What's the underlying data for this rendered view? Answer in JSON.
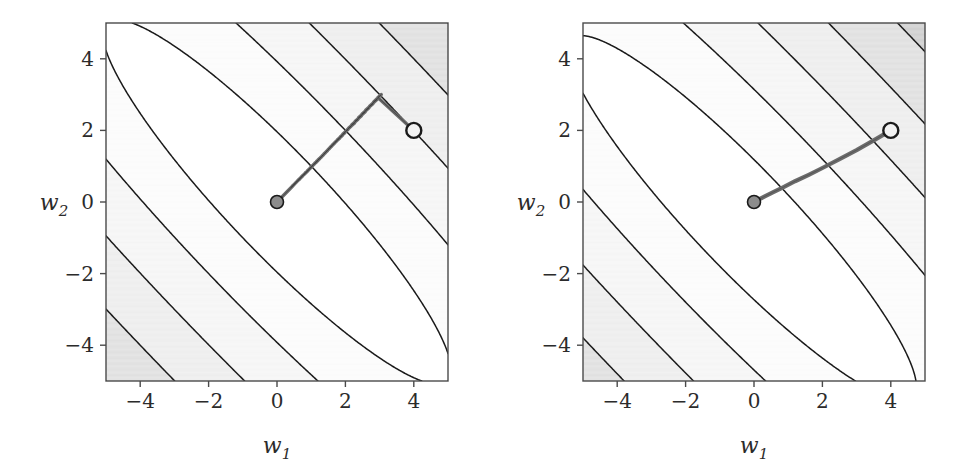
{
  "figure": {
    "background": "#ffffff",
    "panel_count": 2,
    "line_color": "#1a1a1a",
    "path_color": "#6b6b6b",
    "start_marker_fill": "#f2f2f2",
    "end_marker_fill": "#8c8c8c",
    "marker_stroke": "#1a1a1a"
  },
  "chart_data": [
    {
      "type": "line",
      "title": "",
      "subtitle": "",
      "panel": "left",
      "xlabel": "w_1",
      "xlabel_display": "w",
      "xlabel_sub": "1",
      "ylabel": "w_2",
      "ylabel_display": "w",
      "ylabel_sub": "2",
      "xlim": [
        -5,
        5
      ],
      "ylim": [
        -5,
        5
      ],
      "xticks": [
        -4,
        -2,
        0,
        2,
        4
      ],
      "xticklabels": [
        "-4",
        "-2",
        "0",
        "2",
        "4"
      ],
      "yticks": [
        -4,
        -2,
        0,
        2,
        4
      ],
      "yticklabels": [
        "-4",
        "-2",
        "0",
        "2",
        "4"
      ],
      "grid": false,
      "legend": "none",
      "background_type": "filled-contour-grayscale",
      "contour_description": "Elongated concentric ellipses of an ill-conditioned quadratic, major axis along the +45 degree diagonal, centred at the origin; outer levels become straight diagonal bands shaded from white near the valley to dark grey in the top-left and bottom-right corners.",
      "contour_levels": [
        2,
        8,
        18,
        32,
        50,
        72,
        98,
        128,
        162
      ],
      "band_colors": [
        "#ffffff",
        "#fbfbfb",
        "#f4f4f4",
        "#ebebeb",
        "#dcdcdc",
        "#c9c9c9",
        "#a8a8a8",
        "#808080"
      ],
      "ellipse_axis_ratio": 0.2,
      "ellipse_rotation_deg": -45,
      "series": [
        {
          "name": "gradient-descent-zigzag-path",
          "description": "Zig-zagging gradient descent trajectory oscillating across the narrow valley while slowly creeping toward the minimum.",
          "start": [
            4,
            2
          ],
          "end": [
            0,
            0
          ],
          "oscillation_count": 46,
          "x": [
            4.0,
            2.95,
            3.05,
            2.82,
            2.93,
            2.7,
            2.81,
            2.59,
            2.69,
            2.48,
            2.58,
            2.38,
            2.47,
            2.28,
            2.37,
            2.18,
            2.27,
            2.09,
            2.17,
            2.0,
            2.08,
            1.92,
            1.99,
            1.84,
            1.91,
            1.76,
            1.83,
            1.69,
            1.75,
            1.62,
            1.68,
            1.55,
            1.61,
            1.49,
            1.54,
            1.43,
            1.48,
            1.37,
            1.42,
            1.31,
            1.36,
            1.26,
            1.3,
            1.2,
            1.25,
            1.15,
            1.2,
            1.1,
            1.15,
            1.06,
            1.1,
            1.01,
            1.05,
            0.97,
            1.01,
            0.93,
            0.97,
            0.89,
            0.93,
            0.86,
            0.89,
            0.82,
            0.85,
            0.79,
            0.82,
            0.75,
            0.78,
            0.72,
            0.75,
            0.69,
            0.72,
            0.66,
            0.69,
            0.63,
            0.66,
            0.61,
            0.63,
            0.58,
            0.6,
            0.56,
            0.58,
            0.53,
            0.55,
            0.51,
            0.53,
            0.49,
            0.51,
            0.47,
            0.49,
            0.45,
            0.47,
            0.43,
            0.45,
            0.41,
            0.43,
            0.0
          ],
          "y": [
            2.0,
            2.92,
            3.0,
            2.79,
            2.87,
            2.67,
            2.75,
            2.56,
            2.63,
            2.45,
            2.52,
            2.35,
            2.41,
            2.25,
            2.31,
            2.15,
            2.21,
            2.06,
            2.12,
            1.97,
            2.03,
            1.89,
            1.94,
            1.81,
            1.86,
            1.73,
            1.78,
            1.66,
            1.71,
            1.59,
            1.64,
            1.52,
            1.57,
            1.46,
            1.5,
            1.4,
            1.44,
            1.34,
            1.38,
            1.28,
            1.32,
            1.23,
            1.26,
            1.18,
            1.21,
            1.13,
            1.16,
            1.08,
            1.11,
            1.04,
            1.07,
            0.99,
            1.02,
            0.95,
            0.98,
            0.91,
            0.94,
            0.87,
            0.9,
            0.84,
            0.86,
            0.8,
            0.83,
            0.77,
            0.79,
            0.74,
            0.76,
            0.71,
            0.73,
            0.68,
            0.7,
            0.65,
            0.67,
            0.62,
            0.64,
            0.6,
            0.62,
            0.57,
            0.59,
            0.55,
            0.57,
            0.52,
            0.54,
            0.5,
            0.52,
            0.48,
            0.5,
            0.46,
            0.48,
            0.44,
            0.46,
            0.42,
            0.44,
            0.4,
            0.42,
            0.0
          ]
        }
      ],
      "markers": [
        {
          "name": "start-point",
          "x": 4,
          "y": 2,
          "style": "open-white-circle"
        },
        {
          "name": "end-point",
          "x": 0,
          "y": 0,
          "style": "filled-grey-circle"
        }
      ]
    },
    {
      "type": "line",
      "title": "",
      "subtitle": "",
      "panel": "right",
      "xlabel": "w_1",
      "xlabel_display": "w",
      "xlabel_sub": "1",
      "ylabel": "w_2",
      "ylabel_display": "w",
      "ylabel_sub": "2",
      "xlim": [
        -5,
        5
      ],
      "ylim": [
        -5,
        5
      ],
      "xticks": [
        -4,
        -2,
        0,
        2,
        4
      ],
      "xticklabels": [
        "-4",
        "-2",
        "0",
        "2",
        "4"
      ],
      "yticks": [
        -4,
        -2,
        0,
        2,
        4
      ],
      "yticklabels": [
        "-4",
        "-2",
        "0",
        "2",
        "4"
      ],
      "grid": false,
      "legend": "none",
      "background_type": "filled-contour-grayscale",
      "contour_description": "Same ill-conditioned quadratic contours as the left panel; concentric ellipses rotated 45 degrees with the innermost level slightly offset below-left of the origin.",
      "contour_levels": [
        2,
        8,
        18,
        32,
        50,
        72,
        98,
        128,
        162
      ],
      "band_colors": [
        "#ffffff",
        "#fbfbfb",
        "#f4f4f4",
        "#ebebeb",
        "#dcdcdc",
        "#c9c9c9",
        "#a8a8a8",
        "#808080"
      ],
      "ellipse_axis_ratio": 0.2,
      "ellipse_rotation_deg": -45,
      "series": [
        {
          "name": "accelerated-smooth-path",
          "description": "Smooth, nearly direct descent path from the start point to the minimum with a single gentle curve.",
          "start": [
            4,
            2
          ],
          "end": [
            0,
            0
          ],
          "oscillation_count": 0,
          "x": [
            4.0,
            3.5,
            3.0,
            2.5,
            2.0,
            1.6,
            1.2,
            0.85,
            0.55,
            0.3,
            0.12,
            0.0
          ],
          "y": [
            2.0,
            1.72,
            1.45,
            1.2,
            0.95,
            0.76,
            0.58,
            0.41,
            0.27,
            0.15,
            0.06,
            0.0
          ]
        }
      ],
      "markers": [
        {
          "name": "start-point",
          "x": 4,
          "y": 2,
          "style": "open-white-circle"
        },
        {
          "name": "end-point",
          "x": 0,
          "y": 0,
          "style": "filled-grey-circle"
        }
      ]
    }
  ]
}
